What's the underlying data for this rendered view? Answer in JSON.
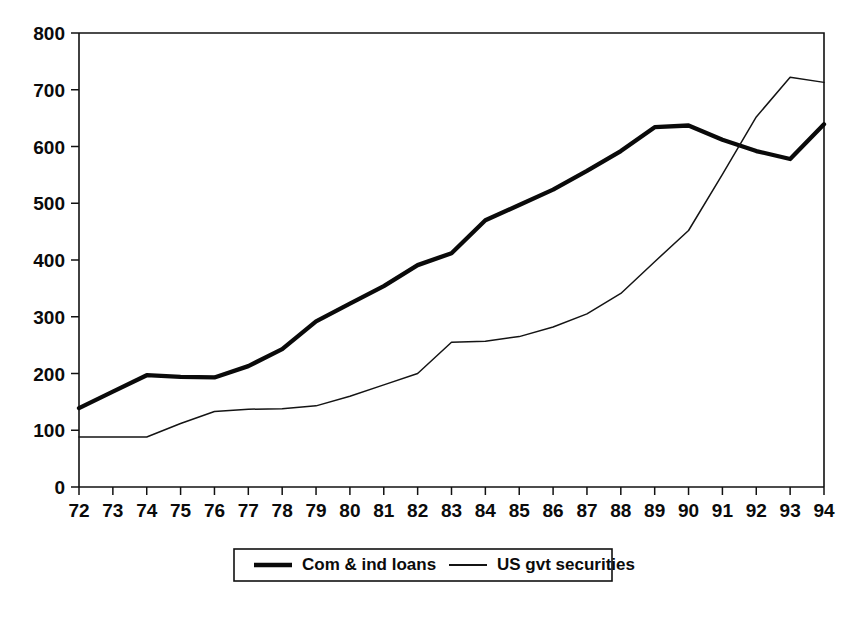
{
  "chart_data": {
    "type": "line",
    "title": "",
    "subtitle": "",
    "xlabel": "",
    "ylabel": "",
    "xlim": [
      72,
      94
    ],
    "ylim": [
      0,
      800
    ],
    "grid": false,
    "legend_position": "bottom",
    "x": [
      72,
      73,
      74,
      75,
      76,
      77,
      78,
      79,
      80,
      81,
      82,
      83,
      84,
      85,
      86,
      87,
      88,
      89,
      90,
      91,
      92,
      93,
      94
    ],
    "categories": [
      "72",
      "73",
      "74",
      "75",
      "76",
      "77",
      "78",
      "79",
      "80",
      "81",
      "82",
      "83",
      "84",
      "85",
      "86",
      "87",
      "88",
      "89",
      "90",
      "91",
      "92",
      "93",
      "94"
    ],
    "y_ticks": [
      0,
      100,
      200,
      300,
      400,
      500,
      600,
      700,
      800
    ],
    "y_tick_labels": [
      "0",
      "100",
      "200",
      "300",
      "400",
      "500",
      "600",
      "700",
      "800"
    ],
    "x_ticks": [
      72,
      73,
      74,
      75,
      76,
      77,
      78,
      79,
      80,
      81,
      82,
      83,
      84,
      85,
      86,
      87,
      88,
      89,
      90,
      91,
      92,
      93,
      94
    ],
    "x_tick_labels": [
      "72",
      "73",
      "74",
      "75",
      "76",
      "77",
      "78",
      "79",
      "80",
      "81",
      "82",
      "83",
      "84",
      "85",
      "86",
      "87",
      "88",
      "89",
      "90",
      "91",
      "92",
      "93",
      "94"
    ],
    "series": [
      {
        "name": "Com & ind loans",
        "style": "thick",
        "color": "#0a0a0a",
        "values": [
          139,
          168,
          197,
          194,
          193,
          213,
          243,
          292,
          323,
          354,
          391,
          412,
          470,
          497,
          524,
          557,
          592,
          634,
          637,
          612,
          592,
          578,
          639
        ]
      },
      {
        "name": "US gvt securities",
        "style": "thin",
        "color": "#141414",
        "values": [
          88,
          88,
          88,
          112,
          133,
          137,
          138,
          143,
          160,
          180,
          200,
          255,
          257,
          265,
          282,
          305,
          341,
          397,
          452,
          551,
          652,
          722,
          713
        ]
      }
    ],
    "legend": [
      {
        "label": "Com & ind loans",
        "style": "thick"
      },
      {
        "label": "US gvt securities",
        "style": "thin"
      }
    ]
  },
  "geometry": {
    "plot_left": 79,
    "plot_right": 824,
    "plot_top": 33,
    "plot_bottom": 487,
    "legend_x": 234,
    "legend_y": 549,
    "legend_w": 378,
    "legend_h": 32
  }
}
